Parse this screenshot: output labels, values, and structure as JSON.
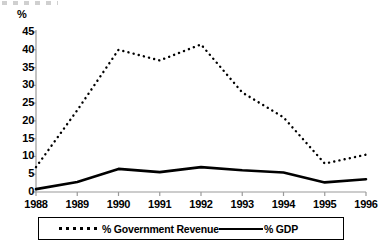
{
  "chart_data": {
    "type": "line",
    "title": "",
    "subtitle": "",
    "xlabel": "",
    "ylabel": "%",
    "unit_label": "%",
    "categories": [
      "1988",
      "1989",
      "1990",
      "1991",
      "1992",
      "1993",
      "1994",
      "1995",
      "1996"
    ],
    "x": [
      1988,
      1989,
      1990,
      1991,
      1992,
      1993,
      1994,
      1995,
      1996
    ],
    "xlim": [
      1988,
      1996
    ],
    "ylim": [
      0,
      45
    ],
    "ytick_values": [
      0,
      5,
      10,
      15,
      20,
      25,
      30,
      35,
      40,
      45
    ],
    "ytick_labels": [
      "0",
      "5",
      "10",
      "15",
      "20",
      "25",
      "30",
      "35",
      "40",
      "45"
    ],
    "xtick_labels": [
      "1988",
      "1989",
      "1990",
      "1991",
      "1992",
      "1993",
      "1994",
      "1995",
      "1996"
    ],
    "grid": false,
    "legend_position": "bottom",
    "series": [
      {
        "name": "% Government Revenue",
        "style": "dotted",
        "color": "#000000",
        "values": [
          7.0,
          23.0,
          40.0,
          37.0,
          41.5,
          28.0,
          21.0,
          8.0,
          10.5
        ]
      },
      {
        "name": "% GDP",
        "style": "solid",
        "color": "#000000",
        "values": [
          0.8,
          2.8,
          6.5,
          5.6,
          7.0,
          6.1,
          5.5,
          2.7,
          3.6
        ]
      }
    ],
    "annotations": []
  },
  "legend": {
    "entries": [
      {
        "label": "% Government Revenue",
        "style": "dotted"
      },
      {
        "label": "% GDP",
        "style": "solid"
      }
    ]
  },
  "colors": {
    "axis": "#9a9a9a",
    "series": "#000000",
    "background": "#ffffff",
    "legend_border": "#000000"
  }
}
